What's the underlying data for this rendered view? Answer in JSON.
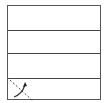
{
  "diagram": {
    "rows": 4,
    "stroke_color": "#444444",
    "background": "#ffffff",
    "bottom_cell_glyph": {
      "dashed_line": "diagonal",
      "arrow": "curved-up-right"
    }
  }
}
